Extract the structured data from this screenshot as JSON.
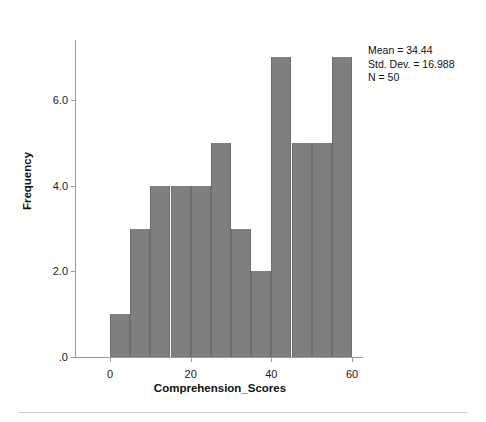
{
  "chart_data": {
    "type": "bar",
    "title": "",
    "subtitle": "",
    "xlabel": "Comprehension_Scores",
    "ylabel": "Frequency",
    "grid": false,
    "legend_position": "none",
    "bin_width": 5,
    "xlim": [
      -5,
      65
    ],
    "ylim": [
      0,
      7.4
    ],
    "xticks": [
      0,
      20,
      40,
      60
    ],
    "xtick_labels": [
      "0",
      "20",
      "40",
      "60"
    ],
    "yticks": [
      0,
      2,
      4,
      6
    ],
    "ytick_labels": [
      ".0",
      "2.0",
      "4.0",
      "6.0"
    ],
    "categories": [
      "0-5",
      "5-10",
      "10-15",
      "15-20",
      "20-25",
      "25-30",
      "30-35",
      "35-40",
      "40-45",
      "45-50",
      "50-55",
      "55-60"
    ],
    "bin_starts": [
      0,
      5,
      10,
      15,
      20,
      25,
      30,
      35,
      40,
      45,
      50,
      55
    ],
    "values": [
      1,
      3,
      4,
      4,
      4,
      5,
      3,
      2,
      7,
      5,
      5,
      7
    ],
    "bar_color": "#7f7f7f",
    "bar_edge_color": "#6e6e6e",
    "axis_color": "#9a9a9a",
    "annotations": {
      "mean_label": "Mean = 34.44",
      "stddev_label": "Std. Dev. = 16.988",
      "n_label": "N = 50",
      "mean": 34.44,
      "std_dev": 16.988,
      "n": 50
    }
  }
}
